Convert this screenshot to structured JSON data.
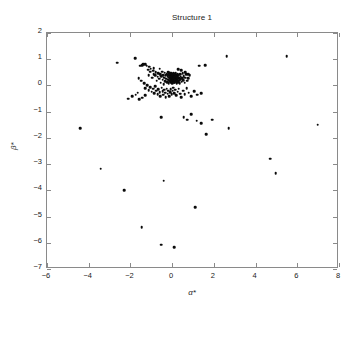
{
  "chart_data": {
    "type": "scatter",
    "title": "Structure 1",
    "xlabel": "α*",
    "ylabel": "β*",
    "xlim": [
      -6,
      8
    ],
    "ylim": [
      -7,
      2
    ],
    "xticks": [
      -6,
      -4,
      -2,
      0,
      2,
      4,
      6,
      8
    ],
    "yticks": [
      2,
      1,
      0,
      -1,
      -2,
      -3,
      -4,
      -5,
      -6,
      -7
    ],
    "xtick_labels": [
      "-6",
      "-4",
      "-2",
      "0",
      "2",
      "4",
      "6",
      "8"
    ],
    "ytick_labels": [
      "2",
      "1",
      "0",
      "-1",
      "-2",
      "-3",
      "-4",
      "-5",
      "-6",
      "-7"
    ],
    "grid": false,
    "legend": null,
    "marker": "filled-circle",
    "marker_color": "#0a0a0a",
    "marker_size": 2.6,
    "series": [
      {
        "name": "samples",
        "points": [
          [
            -2.62,
            0.86
          ],
          [
            -1.78,
            1.05
          ],
          [
            -1.52,
            0.75
          ],
          [
            -1.44,
            0.78
          ],
          [
            -1.38,
            0.82
          ],
          [
            -1.3,
            0.8
          ],
          [
            -1.22,
            0.76
          ],
          [
            -1.15,
            0.6
          ],
          [
            -1.1,
            0.72
          ],
          [
            -1.02,
            0.64
          ],
          [
            -0.96,
            0.3
          ],
          [
            -0.92,
            0.56
          ],
          [
            -0.88,
            0.44
          ],
          [
            -0.82,
            0.38
          ],
          [
            -0.78,
            0.5
          ],
          [
            -0.74,
            0.18
          ],
          [
            -0.7,
            0.34
          ],
          [
            -0.66,
            0.46
          ],
          [
            -0.62,
            0.26
          ],
          [
            -0.58,
            0.42
          ],
          [
            -0.55,
            0.1
          ],
          [
            -0.52,
            0.36
          ],
          [
            -0.48,
            0.52
          ],
          [
            -0.45,
            0.22
          ],
          [
            -0.42,
            0.4
          ],
          [
            -0.4,
            0.05
          ],
          [
            -0.37,
            0.3
          ],
          [
            -0.35,
            0.48
          ],
          [
            -0.33,
            0.16
          ],
          [
            -0.3,
            0.38
          ],
          [
            -0.28,
            0.26
          ],
          [
            -0.26,
            0.44
          ],
          [
            -0.24,
            0.12
          ],
          [
            -0.22,
            0.34
          ],
          [
            -0.2,
            0.5
          ],
          [
            -0.19,
            0.22
          ],
          [
            -0.18,
            0.4
          ],
          [
            -0.16,
            0.08
          ],
          [
            -0.15,
            0.3
          ],
          [
            -0.14,
            0.46
          ],
          [
            -0.13,
            0.18
          ],
          [
            -0.12,
            0.36
          ],
          [
            -0.11,
            0.26
          ],
          [
            -0.1,
            0.42
          ],
          [
            -0.09,
            0.14
          ],
          [
            -0.08,
            0.32
          ],
          [
            -0.08,
            0.48
          ],
          [
            -0.07,
            0.22
          ],
          [
            -0.07,
            0.38
          ],
          [
            -0.06,
            0.1
          ],
          [
            -0.06,
            0.28
          ],
          [
            -0.05,
            0.44
          ],
          [
            -0.05,
            0.18
          ],
          [
            -0.04,
            0.34
          ],
          [
            -0.04,
            0.24
          ],
          [
            -0.03,
            0.4
          ],
          [
            -0.03,
            0.12
          ],
          [
            -0.02,
            0.3
          ],
          [
            -0.02,
            0.46
          ],
          [
            -0.01,
            0.2
          ],
          [
            -0.01,
            0.36
          ],
          [
            0.0,
            0.08
          ],
          [
            0.0,
            0.26
          ],
          [
            0.0,
            0.42
          ],
          [
            0.01,
            0.16
          ],
          [
            0.01,
            0.32
          ],
          [
            0.02,
            0.22
          ],
          [
            0.02,
            0.38
          ],
          [
            0.03,
            0.1
          ],
          [
            0.03,
            0.28
          ],
          [
            0.04,
            0.44
          ],
          [
            0.04,
            0.18
          ],
          [
            0.05,
            0.34
          ],
          [
            0.05,
            0.24
          ],
          [
            0.06,
            0.4
          ],
          [
            0.06,
            0.14
          ],
          [
            0.07,
            0.3
          ],
          [
            0.07,
            0.46
          ],
          [
            0.08,
            0.2
          ],
          [
            0.08,
            0.36
          ],
          [
            0.09,
            0.12
          ],
          [
            0.09,
            0.26
          ],
          [
            0.1,
            0.42
          ],
          [
            0.1,
            0.18
          ],
          [
            0.11,
            0.32
          ],
          [
            0.12,
            0.24
          ],
          [
            0.12,
            0.38
          ],
          [
            0.13,
            0.1
          ],
          [
            0.14,
            0.28
          ],
          [
            0.14,
            0.44
          ],
          [
            0.15,
            0.2
          ],
          [
            0.16,
            0.34
          ],
          [
            0.17,
            0.14
          ],
          [
            0.18,
            0.3
          ],
          [
            0.18,
            0.46
          ],
          [
            0.19,
            0.22
          ],
          [
            0.2,
            0.36
          ],
          [
            0.21,
            0.08
          ],
          [
            0.22,
            0.26
          ],
          [
            0.23,
            0.4
          ],
          [
            0.24,
            0.16
          ],
          [
            0.25,
            0.32
          ],
          [
            0.26,
            0.22
          ],
          [
            0.27,
            0.44
          ],
          [
            0.28,
            0.12
          ],
          [
            0.3,
            0.28
          ],
          [
            0.31,
            0.38
          ],
          [
            0.33,
            0.18
          ],
          [
            0.35,
            0.3
          ],
          [
            0.36,
            0.08
          ],
          [
            0.38,
            0.42
          ],
          [
            0.4,
            0.24
          ],
          [
            0.42,
            0.34
          ],
          [
            0.45,
            0.14
          ],
          [
            0.48,
            0.28
          ],
          [
            0.5,
            0.46
          ],
          [
            0.53,
            0.2
          ],
          [
            0.56,
            0.36
          ],
          [
            0.6,
            0.1
          ],
          [
            0.64,
            0.3
          ],
          [
            0.68,
            0.42
          ],
          [
            0.72,
            0.18
          ],
          [
            0.78,
            0.28
          ],
          [
            0.85,
            0.38
          ],
          [
            -1.6,
            0.28
          ],
          [
            -1.48,
            0.18
          ],
          [
            -1.35,
            0.08
          ],
          [
            -1.28,
            -0.1
          ],
          [
            -1.2,
            0.02
          ],
          [
            -1.12,
            -0.18
          ],
          [
            -1.05,
            -0.06
          ],
          [
            -0.98,
            -0.24
          ],
          [
            -0.92,
            -0.12
          ],
          [
            -0.86,
            -0.3
          ],
          [
            -0.8,
            -0.02
          ],
          [
            -0.76,
            -0.2
          ],
          [
            -0.7,
            -0.34
          ],
          [
            -0.66,
            -0.14
          ],
          [
            -0.6,
            -0.26
          ],
          [
            -0.56,
            -0.4
          ],
          [
            -0.5,
            -0.08
          ],
          [
            -0.46,
            -0.22
          ],
          [
            -0.42,
            -0.36
          ],
          [
            -0.38,
            -0.16
          ],
          [
            -0.34,
            -0.28
          ],
          [
            -0.3,
            -0.44
          ],
          [
            -0.26,
            -0.12
          ],
          [
            -0.22,
            -0.32
          ],
          [
            -0.18,
            -0.2
          ],
          [
            -0.14,
            -0.4
          ],
          [
            -0.1,
            -0.26
          ],
          [
            -0.06,
            -0.14
          ],
          [
            -0.02,
            -0.34
          ],
          [
            0.02,
            -0.2
          ],
          [
            0.06,
            -0.08
          ],
          [
            0.1,
            -0.3
          ],
          [
            0.15,
            -0.16
          ],
          [
            0.2,
            -0.38
          ],
          [
            0.26,
            -0.24
          ],
          [
            0.32,
            -0.12
          ],
          [
            0.38,
            -0.32
          ],
          [
            0.44,
            -0.44
          ],
          [
            0.52,
            -0.2
          ],
          [
            0.6,
            -0.34
          ],
          [
            0.7,
            -0.1
          ],
          [
            0.8,
            -0.28
          ],
          [
            0.9,
            -0.42
          ],
          [
            1.05,
            -0.22
          ],
          [
            1.2,
            -0.36
          ],
          [
            1.4,
            -0.3
          ],
          [
            -2.1,
            -0.5
          ],
          [
            -1.92,
            -0.42
          ],
          [
            -1.74,
            -0.36
          ],
          [
            -1.66,
            -0.28
          ],
          [
            -1.58,
            -0.52
          ],
          [
            -1.44,
            -0.46
          ],
          [
            -1.3,
            -0.38
          ],
          [
            -1.12,
            0.4
          ],
          [
            -1.04,
            0.52
          ],
          [
            -0.88,
            0.66
          ],
          [
            -0.6,
            0.64
          ],
          [
            0.3,
            0.62
          ],
          [
            0.44,
            0.58
          ],
          [
            0.62,
            0.5
          ],
          [
            0.76,
            0.44
          ],
          [
            1.3,
            0.76
          ],
          [
            1.58,
            0.78
          ],
          [
            2.62,
            1.12
          ],
          [
            5.5,
            1.12
          ],
          [
            -4.42,
            -1.62
          ],
          [
            -3.42,
            -3.18
          ],
          [
            -2.3,
            -4.0
          ],
          [
            -1.46,
            -5.4
          ],
          [
            -0.52,
            -6.08
          ],
          [
            -0.52,
            -1.2
          ],
          [
            -0.4,
            -3.64
          ],
          [
            0.1,
            -6.16
          ],
          [
            0.55,
            -1.22
          ],
          [
            0.72,
            -1.3
          ],
          [
            0.9,
            -1.1
          ],
          [
            1.1,
            -4.65
          ],
          [
            1.18,
            -1.34
          ],
          [
            1.4,
            -1.44
          ],
          [
            1.62,
            -1.86
          ],
          [
            1.92,
            -1.3
          ],
          [
            2.72,
            -1.64
          ],
          [
            4.7,
            -2.8
          ],
          [
            4.96,
            -3.35
          ],
          [
            6.98,
            -1.5
          ]
        ]
      }
    ]
  },
  "axes": {
    "frame_color": "#8a8a8a",
    "background": "#ffffff"
  }
}
